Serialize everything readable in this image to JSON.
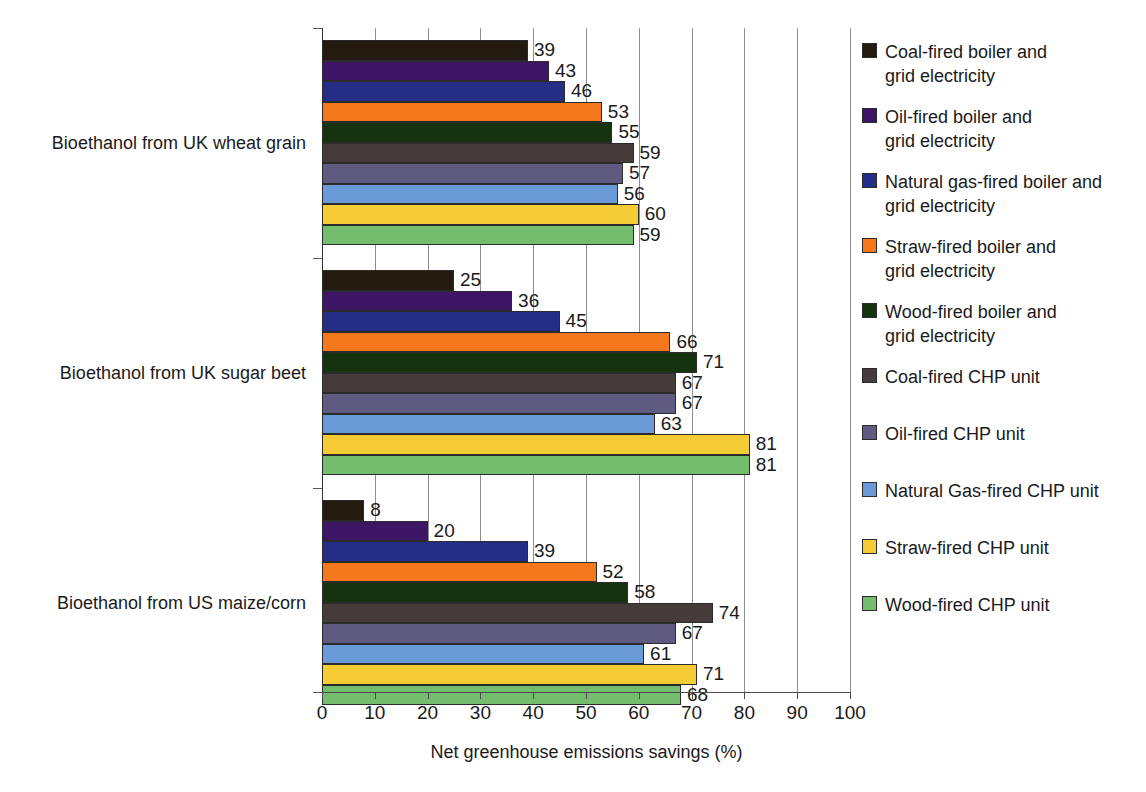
{
  "chart_data": {
    "type": "bar",
    "orientation": "horizontal",
    "title": "",
    "xlabel": "Net greenhouse emissions savings (%)",
    "ylabel": "",
    "xlim": [
      0,
      100
    ],
    "xticks": [
      0,
      10,
      20,
      30,
      40,
      50,
      60,
      70,
      80,
      90,
      100
    ],
    "grid": true,
    "legend_position": "right",
    "categories": [
      "Bioethanol from UK wheat grain",
      "Bioethanol from UK sugar beet",
      "Bioethanol from US maize/corn"
    ],
    "series": [
      {
        "name": "Coal-fired boiler and\ngrid electricity",
        "color": "#231a10",
        "values": [
          39,
          25,
          8
        ]
      },
      {
        "name": "Oil-fired boiler and\ngrid electricity",
        "color": "#3d1466",
        "values": [
          43,
          36,
          20
        ]
      },
      {
        "name": "Natural gas-fired boiler and\ngrid electricity",
        "color": "#242e86",
        "values": [
          46,
          45,
          39
        ]
      },
      {
        "name": "Straw-fired boiler and\ngrid electricity",
        "color": "#f5781c",
        "values": [
          53,
          66,
          52
        ]
      },
      {
        "name": "Wood-fired boiler and\ngrid electricity",
        "color": "#16330f",
        "values": [
          55,
          71,
          58
        ]
      },
      {
        "name": "Coal-fired CHP unit",
        "color": "#453b3b",
        "values": [
          59,
          67,
          74
        ]
      },
      {
        "name": "Oil-fired CHP unit",
        "color": "#5e5a80",
        "values": [
          57,
          67,
          67
        ]
      },
      {
        "name": "Natural Gas-fired CHP unit",
        "color": "#6b9bd6",
        "values": [
          56,
          63,
          61
        ]
      },
      {
        "name": "Straw-fired CHP unit",
        "color": "#f5cb36",
        "values": [
          60,
          81,
          71
        ]
      },
      {
        "name": "Wood-fired CHP unit",
        "color": "#74bd6e",
        "values": [
          59,
          81,
          68
        ]
      }
    ]
  },
  "axis": {
    "x_title": "Net greenhouse emissions savings (%)",
    "tick_labels": [
      "0",
      "10",
      "20",
      "30",
      "40",
      "50",
      "60",
      "70",
      "80",
      "90",
      "100"
    ]
  },
  "categories": {
    "wheat": "Bioethanol from UK wheat grain",
    "beet": "Bioethanol from UK sugar beet",
    "maize": "Bioethanol from US maize/corn"
  },
  "legend": {
    "items": [
      {
        "label": "Coal-fired boiler and\ngrid electricity",
        "color": "#231a10"
      },
      {
        "label": "Oil-fired boiler and\ngrid electricity",
        "color": "#3d1466"
      },
      {
        "label": "Natural gas-fired boiler and\ngrid electricity",
        "color": "#242e86"
      },
      {
        "label": "Straw-fired boiler and\ngrid electricity",
        "color": "#f5781c"
      },
      {
        "label": "Wood-fired boiler and\ngrid electricity",
        "color": "#16330f"
      },
      {
        "label": "Coal-fired CHP unit",
        "color": "#453b3b"
      },
      {
        "label": "Oil-fired CHP unit",
        "color": "#5e5a80"
      },
      {
        "label": "Natural Gas-fired CHP unit",
        "color": "#6b9bd6"
      },
      {
        "label": "Straw-fired CHP unit",
        "color": "#f5cb36"
      },
      {
        "label": "Wood-fired CHP unit",
        "color": "#74bd6e"
      }
    ]
  }
}
